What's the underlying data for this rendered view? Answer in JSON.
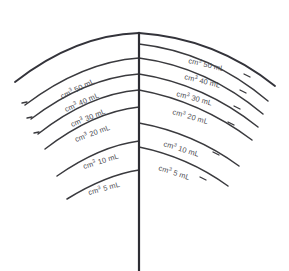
{
  "figure": {
    "background_color": "#ffffff",
    "line_color": "#3a3a3e",
    "text_color": "#4a4a50",
    "unit_volume": "cm",
    "unit_capacity": "mL",
    "superscript": "3"
  },
  "center_line": {
    "name": "vertical-axis",
    "x": 139,
    "y_top": 33,
    "y_bottom": 271
  },
  "labels": {
    "left": [
      {
        "text": "cm3 50 mL",
        "value": 50,
        "unit": "mL",
        "x": 62,
        "y": 99,
        "rotate": -26
      },
      {
        "text": "cm3 40 mL",
        "value": 40,
        "unit": "mL",
        "x": 66,
        "y": 112,
        "rotate": -24
      },
      {
        "text": "cm3 30 mL",
        "value": 30,
        "unit": "mL",
        "x": 72,
        "y": 127,
        "rotate": -22
      },
      {
        "text": "cm3 20 mL",
        "value": 20,
        "unit": "mL",
        "x": 76,
        "y": 142,
        "rotate": -20
      },
      {
        "text": "cm3 10 mL",
        "value": 10,
        "unit": "mL",
        "x": 84,
        "y": 169,
        "rotate": -17
      },
      {
        "text": "cm3 5 mL",
        "value": 5,
        "unit": "mL",
        "x": 89,
        "y": 195,
        "rotate": -15
      }
    ],
    "right": [
      {
        "text": "cm3 50 mL",
        "value": 50,
        "unit": "mL",
        "x": 188,
        "y": 63,
        "rotate": 13
      },
      {
        "text": "cm3 40 mL",
        "value": 40,
        "unit": "mL",
        "x": 184,
        "y": 79,
        "rotate": 14
      },
      {
        "text": "cm3 30 mL",
        "value": 30,
        "unit": "mL",
        "x": 176,
        "y": 96,
        "rotate": 15
      },
      {
        "text": "cm3 20 mL",
        "value": 20,
        "unit": "mL",
        "x": 172,
        "y": 114,
        "rotate": 16
      },
      {
        "text": "cm3 10 mL",
        "value": 10,
        "unit": "mL",
        "x": 163,
        "y": 146,
        "rotate": 17
      },
      {
        "text": "cm3 5 mL",
        "value": 5,
        "unit": "mL",
        "x": 158,
        "y": 170,
        "rotate": 18
      }
    ]
  },
  "chart_data": {
    "type": "line",
    "xlabel": "",
    "ylabel": "Volume",
    "categories": [
      "5 mL",
      "10 mL",
      "20 mL",
      "30 mL",
      "40 mL",
      "50 mL"
    ],
    "values": [
      5,
      10,
      20,
      30,
      40,
      50
    ],
    "series": [
      {
        "name": "left-scale",
        "values": [
          5,
          10,
          20,
          30,
          40,
          50
        ]
      },
      {
        "name": "right-scale",
        "values": [
          5,
          10,
          20,
          30,
          40,
          50
        ]
      }
    ],
    "grid": false,
    "legend": "none",
    "annotations": [
      "cm3 50 mL",
      "cm3 40 mL",
      "cm3 30 mL",
      "cm3 20 mL",
      "cm3 10 mL",
      "cm3 5 mL"
    ]
  },
  "arcs": {
    "left": [
      {
        "name": "arc-left-outermost",
        "d": "M 15 82 Q 75 35 139 33",
        "weight": "heavy"
      },
      {
        "name": "arc-left-50",
        "d": "M 25 105 Q 82 62 139 58",
        "weight": "normal"
      },
      {
        "name": "arc-left-40",
        "d": "M 31 119 Q 85 78 139 74",
        "weight": "normal"
      },
      {
        "name": "arc-left-30",
        "d": "M 38 134 Q 89 94 139 90",
        "weight": "normal"
      },
      {
        "name": "arc-left-20",
        "d": "M 45 149 Q 93 112 139 107",
        "weight": "normal"
      },
      {
        "name": "arc-left-10",
        "d": "M 57 176 Q 100 146 139 141",
        "weight": "normal"
      },
      {
        "name": "arc-left-5",
        "d": "M 67 199 Q 106 175 139 170",
        "weight": "normal"
      }
    ],
    "right": [
      {
        "name": "arc-right-outermost",
        "d": "M 139 33 Q 215 38 275 86",
        "weight": "heavy"
      },
      {
        "name": "arc-right-50",
        "d": "M 139 44 Q 210 52 268 101",
        "weight": "normal"
      },
      {
        "name": "arc-right-40",
        "d": "M 139 58 Q 207 67 263 114",
        "weight": "normal"
      },
      {
        "name": "arc-right-30",
        "d": "M 139 74 Q 204 84 258 127",
        "weight": "normal"
      },
      {
        "name": "arc-right-20",
        "d": "M 139 90 Q 200 101 252 140",
        "weight": "normal"
      },
      {
        "name": "arc-right-10",
        "d": "M 139 123 Q 194 133 239 166",
        "weight": "normal"
      },
      {
        "name": "arc-right-5",
        "d": "M 139 147 Q 188 157 228 186",
        "weight": "normal"
      }
    ]
  },
  "leader_dashes": {
    "left": [
      {
        "name": "dash-left-50",
        "x1": 22,
        "y1": 103,
        "x2": 27,
        "y2": 102
      },
      {
        "name": "dash-left-40",
        "x1": 27,
        "y1": 118,
        "x2": 32,
        "y2": 117
      },
      {
        "name": "dash-left-30",
        "x1": 34,
        "y1": 133,
        "x2": 39,
        "y2": 132
      }
    ],
    "right": [
      {
        "name": "dash-right-50",
        "x1": 244,
        "y1": 74,
        "x2": 250,
        "y2": 77
      },
      {
        "name": "dash-right-40",
        "x1": 240,
        "y1": 90,
        "x2": 246,
        "y2": 93
      },
      {
        "name": "dash-right-30",
        "x1": 234,
        "y1": 106,
        "x2": 240,
        "y2": 109
      },
      {
        "name": "dash-right-20",
        "x1": 228,
        "y1": 122,
        "x2": 234,
        "y2": 125
      },
      {
        "name": "dash-right-10",
        "x1": 213,
        "y1": 152,
        "x2": 219,
        "y2": 155
      },
      {
        "name": "dash-right-5",
        "x1": 200,
        "y1": 177,
        "x2": 206,
        "y2": 180
      }
    ]
  }
}
